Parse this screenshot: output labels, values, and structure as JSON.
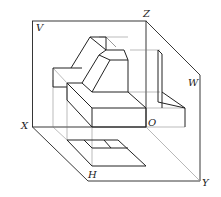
{
  "figure": {
    "type": "three-view projection box diagram",
    "labels": {
      "v": "V",
      "w": "W",
      "h": "H",
      "x": "X",
      "y": "Y",
      "z": "Z",
      "o": "O"
    },
    "colors": {
      "stroke": "#222222",
      "thin": "#555555",
      "diag": "#9a9a9a",
      "background": "#ffffff"
    }
  }
}
